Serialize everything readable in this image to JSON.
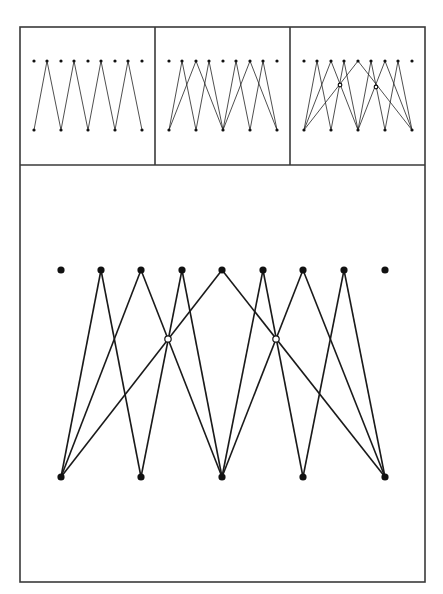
{
  "figure": {
    "colors": {
      "stroke": "#1a1a1a",
      "frame": "#3a3a3a",
      "background": "#ffffff",
      "hollow_fill": "#ffffff"
    },
    "node_layout": {
      "top_row_count": 9,
      "bottom_row_count": 5,
      "bottom_aligns_with_top_indices": [
        0,
        2,
        4,
        6,
        8
      ]
    },
    "panels": [
      {
        "id": "panel-1",
        "edges": [
          [
            "B0",
            "T1"
          ],
          [
            "T1",
            "B1"
          ],
          [
            "B1",
            "T3"
          ],
          [
            "T3",
            "B2"
          ],
          [
            "B2",
            "T5"
          ],
          [
            "T5",
            "B3"
          ],
          [
            "B3",
            "T7"
          ],
          [
            "T7",
            "B4"
          ]
        ],
        "hollow_nodes": []
      },
      {
        "id": "panel-2",
        "edges": [
          [
            "B0",
            "T1"
          ],
          [
            "T1",
            "B1"
          ],
          [
            "B0",
            "T2"
          ],
          [
            "T2",
            "B2"
          ],
          [
            "B1",
            "T3"
          ],
          [
            "T3",
            "B2"
          ],
          [
            "B2",
            "T5"
          ],
          [
            "T5",
            "B3"
          ],
          [
            "B2",
            "T6"
          ],
          [
            "T6",
            "B4"
          ],
          [
            "B3",
            "T7"
          ],
          [
            "T7",
            "B4"
          ]
        ],
        "hollow_nodes": []
      },
      {
        "id": "panel-3",
        "edges": [
          [
            "B0",
            "T1"
          ],
          [
            "T1",
            "B1"
          ],
          [
            "B0",
            "T2"
          ],
          [
            "T2",
            "B2"
          ],
          [
            "B1",
            "T3"
          ],
          [
            "T3",
            "B2"
          ],
          [
            "B0",
            "T4"
          ],
          [
            "T4",
            "B4"
          ],
          [
            "B2",
            "T5"
          ],
          [
            "T5",
            "B3"
          ],
          [
            "B2",
            "T6"
          ],
          [
            "T6",
            "B4"
          ],
          [
            "B3",
            "T7"
          ],
          [
            "T7",
            "B4"
          ]
        ],
        "hollow_nodes": [
          "H0",
          "H1"
        ]
      },
      {
        "id": "panel-large",
        "edges": [
          [
            "B0",
            "T1"
          ],
          [
            "T1",
            "B1"
          ],
          [
            "B0",
            "T2"
          ],
          [
            "T2",
            "B2"
          ],
          [
            "B1",
            "T3"
          ],
          [
            "T3",
            "B2"
          ],
          [
            "B0",
            "T4"
          ],
          [
            "T4",
            "B4"
          ],
          [
            "B2",
            "T5"
          ],
          [
            "T5",
            "B3"
          ],
          [
            "B2",
            "T6"
          ],
          [
            "T6",
            "B4"
          ],
          [
            "B3",
            "T7"
          ],
          [
            "T7",
            "B4"
          ]
        ],
        "hollow_nodes": [
          "H0",
          "H1"
        ]
      }
    ],
    "geometry": {
      "outer_frame": {
        "x": 20,
        "y": 27,
        "w": 405,
        "h": 555
      },
      "small_panel_dividers_x": [
        155,
        290
      ],
      "small_panel_bottom_y": 165,
      "small_panels": [
        {
          "top_x": [
            34,
            47,
            61,
            74,
            88,
            101,
            115,
            128,
            142
          ],
          "top_y": 61,
          "bottom_y": 130
        },
        {
          "top_x": [
            169,
            182,
            196,
            209,
            223,
            236,
            250,
            263,
            277
          ],
          "top_y": 61,
          "bottom_y": 130
        },
        {
          "top_x": [
            304,
            317,
            331,
            344,
            358,
            371,
            385,
            398,
            412
          ],
          "top_y": 61,
          "bottom_y": 130,
          "hollow": [
            [
              340,
              85
            ],
            [
              376,
              87
            ]
          ]
        }
      ],
      "large_panel": {
        "top_x": [
          61,
          101,
          141,
          182,
          222,
          263,
          303,
          344,
          385
        ],
        "top_y": 270,
        "bottom_y": 477,
        "hollow": [
          [
            168,
            339
          ],
          [
            276,
            339
          ]
        ]
      }
    }
  }
}
